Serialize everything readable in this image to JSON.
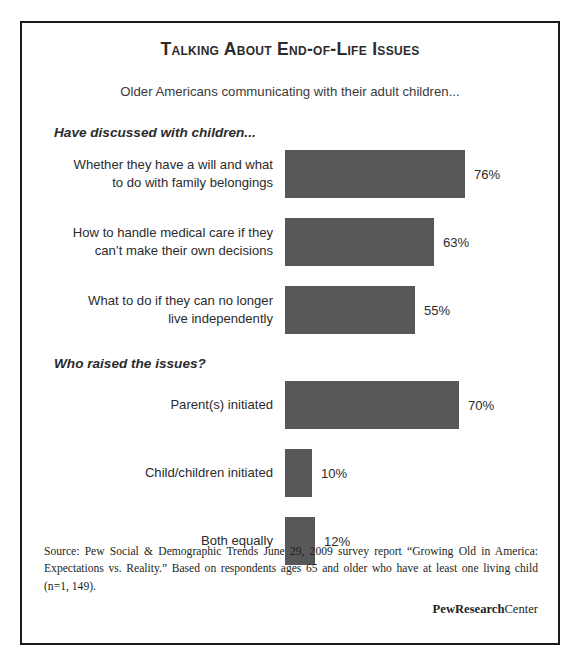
{
  "title": "Talking About End-of-Life Issues",
  "subtitle": "Older Americans communicating with their adult children...",
  "source_note": "Source:  Pew Social & Demographic Trends June 29, 2009 survey report “Growing Old in America: Expectations vs. Reality.” Based on respondents ages 65 and older who have at least one living child (n=1, 149).",
  "brand": {
    "bold_part": "PewResearch",
    "regular_part": "Center"
  },
  "colors": {
    "bar_fill": "#58585a",
    "frame_border": "#1a1a1a",
    "text": "#2b2b2b"
  },
  "chart_data": {
    "type": "bar",
    "title": "Talking About End-of-Life Issues",
    "subtitle": "Older Americans communicating with their adult children...",
    "orientation": "horizontal",
    "xlabel": "",
    "ylabel": "",
    "units": "percent",
    "grid": false,
    "legend": false,
    "sections": [
      {
        "header": "Have discussed with children...",
        "categories": [
          "Whether they have a will and what to do with family belongings",
          "How to handle medical care if they can’t make their own decisions",
          "What to do if they can no longer live independently"
        ],
        "values": [
          76,
          63,
          55
        ],
        "value_labels": [
          "76%",
          "63%",
          "55%"
        ]
      },
      {
        "header": "Who raised the issues?",
        "categories": [
          "Parent(s) initiated",
          "Child/children initiated",
          "Both equally"
        ],
        "values": [
          70,
          10,
          12
        ],
        "value_labels": [
          "70%",
          "10%",
          "12%"
        ]
      }
    ]
  },
  "sections": [
    {
      "header": "Have discussed with children...",
      "bars": [
        {
          "label_line1": "Whether they have a will and what",
          "label_line2": "to do with family belongings",
          "value_label": "76%",
          "bar_px": 180
        },
        {
          "label_line1": "How to handle medical care if they",
          "label_line2": "can’t make their own decisions",
          "value_label": "63%",
          "bar_px": 149
        },
        {
          "label_line1": "What to do if they can no longer",
          "label_line2": "live independently",
          "value_label": "55%",
          "bar_px": 130
        }
      ]
    },
    {
      "header": "Who raised the issues?",
      "bars": [
        {
          "label_line1": "Parent(s) initiated",
          "label_line2": "",
          "value_label": "70%",
          "bar_px": 174
        },
        {
          "label_line1": "Child/children initiated",
          "label_line2": "",
          "value_label": "10%",
          "bar_px": 27
        },
        {
          "label_line1": "Both equally",
          "label_line2": "",
          "value_label": "12%",
          "bar_px": 30
        }
      ]
    }
  ]
}
